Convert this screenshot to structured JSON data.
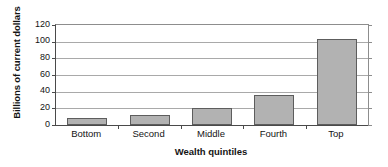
{
  "chart_data": {
    "type": "bar",
    "title": "",
    "xlabel": "Wealth quintiles",
    "ylabel": "Billions of current dollars",
    "categories": [
      "Bottom",
      "Second",
      "Middle",
      "Fourth",
      "Top"
    ],
    "values": [
      8,
      12,
      20,
      36,
      103
    ],
    "ylim": [
      0,
      120
    ],
    "yticks": [
      0,
      20,
      40,
      60,
      80,
      100,
      120
    ],
    "ytick_labels": [
      "0",
      "20",
      "40",
      "60",
      "80",
      "100",
      "120"
    ],
    "grid": true,
    "legend": "none",
    "series": [
      {
        "name": "Wealth",
        "values": [
          8,
          12,
          20,
          36,
          103
        ]
      }
    ],
    "colors": {
      "bar_fill": "#b2b2b2",
      "bar_border": "#5d5d5d",
      "gridline": "#a9a9a9",
      "axis": "#4a4a4a",
      "background": "#ffffff",
      "text": "#141414"
    }
  }
}
